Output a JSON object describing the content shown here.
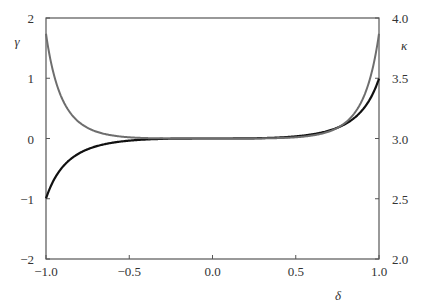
{
  "chart_data": {
    "type": "line",
    "title": "",
    "xlabel": "δ",
    "ylabel": "γ",
    "y2label": "κ",
    "xlim": [
      -1.0,
      1.0
    ],
    "ylim": [
      -2,
      2
    ],
    "y2lim": [
      2.0,
      4.0
    ],
    "grid": false,
    "legend": null,
    "x_ticks": [
      "−1.0",
      "−0.5",
      "0.0",
      "0.5",
      "1.0"
    ],
    "x_tick_values": [
      -1.0,
      -0.5,
      0.0,
      0.5,
      1.0
    ],
    "y_ticks": [
      "2",
      "1",
      "0",
      "−1",
      "−2"
    ],
    "y_tick_values": [
      2,
      1,
      0,
      -1,
      -2
    ],
    "y2_ticks": [
      "4.0",
      "3.5",
      "3.0",
      "2.5",
      "2.0"
    ],
    "y2_tick_values": [
      4.0,
      3.5,
      3.0,
      2.5,
      2.0
    ],
    "x": [
      -1.0,
      -0.9,
      -0.8,
      -0.7,
      -0.6,
      -0.5,
      -0.4,
      -0.3,
      -0.2,
      -0.1,
      0.0,
      0.1,
      0.2,
      0.3,
      0.4,
      0.5,
      0.6,
      0.7,
      0.8,
      0.9,
      1.0
    ],
    "series": [
      {
        "name": "γ (skewness)",
        "axis": "left",
        "color": "#111111",
        "values": [
          -0.995,
          -0.472,
          -0.245,
          -0.131,
          -0.07,
          -0.035,
          -0.016,
          -0.006,
          -0.002,
          -0.0002,
          0.0,
          0.0002,
          0.002,
          0.006,
          0.016,
          0.035,
          0.07,
          0.131,
          0.245,
          0.472,
          0.995
        ]
      },
      {
        "name": "κ (kurtosis)",
        "axis": "right",
        "color": "#6e6e6e",
        "values": [
          3.869,
          3.321,
          3.134,
          3.058,
          3.025,
          3.01,
          3.004,
          3.001,
          3.0,
          3.0,
          3.0,
          3.0,
          3.0,
          3.001,
          3.004,
          3.01,
          3.025,
          3.058,
          3.134,
          3.321,
          3.869
        ]
      }
    ]
  },
  "colors": {
    "axis": "#555555",
    "text": "#333333"
  }
}
